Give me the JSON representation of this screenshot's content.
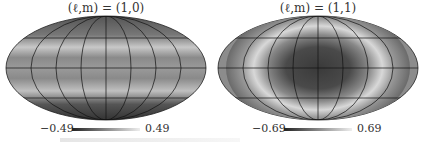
{
  "figure": {
    "panels": [
      {
        "title": "(ℓ,m) = (1,0)",
        "projection": "mollweide",
        "pattern": "horizontal bands (zonal)",
        "colorbar": {
          "min_label": "−0.49",
          "max_label": "0.49"
        }
      },
      {
        "title": "(ℓ,m) = (1,1)",
        "projection": "mollweide",
        "pattern": "dark center lobe, lighter edges",
        "colorbar": {
          "min_label": "−0.69",
          "max_label": "0.69"
        }
      }
    ]
  }
}
